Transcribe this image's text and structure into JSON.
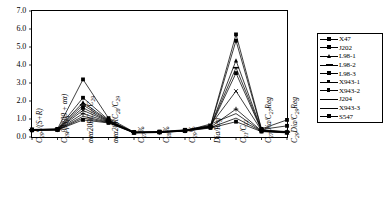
{
  "chart_data": {
    "type": "line",
    "title": "",
    "xlabel": "",
    "ylabel": "",
    "ylim": [
      0.0,
      7.0
    ],
    "ytick_labels": [
      "0.0",
      "1.0",
      "2.0",
      "3.0",
      "4.0",
      "5.0",
      "6.0",
      "7.0"
    ],
    "ytick_values": [
      0.0,
      1.0,
      2.0,
      3.0,
      4.0,
      5.0,
      6.0,
      7.0
    ],
    "grid": false,
    "legend_position": "right",
    "categories": [
      "C29S/(S+R)",
      "C29BB/(BB+aa)",
      "aaa20RC27/C29",
      "aaa20RC28/C29",
      "C27%",
      "C28%",
      "C29%",
      "Dia/Reg",
      "C21/C22",
      "C27Dia/C27Reg",
      "C29Dia/C29Reg"
    ],
    "categories_display": [
      {
        "parts": [
          {
            "t": "C",
            "i": true
          },
          {
            "t": "29",
            "sub": true
          },
          {
            "t": "S/(S+R)",
            "i": true
          }
        ]
      },
      {
        "parts": [
          {
            "t": "C",
            "i": true
          },
          {
            "t": "29",
            "sub": true
          },
          {
            "t": "ββ/(ββ + αα)",
            "i": true
          }
        ]
      },
      {
        "parts": [
          {
            "t": "ααα20RC",
            "i": true
          },
          {
            "t": "27",
            "sub": true
          },
          {
            "t": "/C",
            "i": true
          },
          {
            "t": "29",
            "sub": true
          }
        ]
      },
      {
        "parts": [
          {
            "t": "ααα20RC",
            "i": true
          },
          {
            "t": "28",
            "sub": true
          },
          {
            "t": "/C",
            "i": true
          },
          {
            "t": "29",
            "sub": true
          }
        ]
      },
      {
        "parts": [
          {
            "t": "C",
            "i": true
          },
          {
            "t": "27",
            "sub": true
          },
          {
            "t": "%",
            "i": true
          }
        ]
      },
      {
        "parts": [
          {
            "t": "C",
            "i": true
          },
          {
            "t": "28",
            "sub": true
          },
          {
            "t": "%",
            "i": true
          }
        ]
      },
      {
        "parts": [
          {
            "t": "C",
            "i": true
          },
          {
            "t": "29",
            "sub": true
          },
          {
            "t": "%",
            "i": true
          }
        ]
      },
      {
        "parts": [
          {
            "t": "Dia/Reg",
            "i": true
          }
        ]
      },
      {
        "parts": [
          {
            "t": "C",
            "i": true
          },
          {
            "t": "21",
            "sub": true
          },
          {
            "t": "/C",
            "i": true
          },
          {
            "t": "22",
            "sub": true
          }
        ]
      },
      {
        "parts": [
          {
            "t": "C",
            "i": true
          },
          {
            "t": "27",
            "sub": true
          },
          {
            "t": "Dia/C",
            "i": true
          },
          {
            "t": "27",
            "sub": true
          },
          {
            "t": "Reg",
            "i": true
          }
        ]
      },
      {
        "parts": [
          {
            "t": "C",
            "i": true
          },
          {
            "t": "29",
            "sub": true
          },
          {
            "t": "Dia/C",
            "i": true
          },
          {
            "t": "29",
            "sub": true
          },
          {
            "t": "Reg",
            "i": true
          }
        ]
      }
    ],
    "series": [
      {
        "name": "X47",
        "marker": "square",
        "values": [
          0.42,
          0.45,
          3.2,
          1.05,
          0.28,
          0.3,
          0.4,
          0.62,
          5.7,
          0.45,
          0.95
        ]
      },
      {
        "name": "J202",
        "marker": "square-filled",
        "values": [
          0.4,
          0.44,
          2.18,
          0.95,
          0.26,
          0.29,
          0.38,
          0.6,
          5.35,
          0.42,
          0.62
        ]
      },
      {
        "name": "L98-1",
        "marker": "triangle",
        "values": [
          0.41,
          0.43,
          1.92,
          0.92,
          0.27,
          0.28,
          0.37,
          0.58,
          4.25,
          0.4,
          0.3
        ]
      },
      {
        "name": "L98-2",
        "marker": "dash",
        "values": [
          0.4,
          0.42,
          1.78,
          0.9,
          0.26,
          0.28,
          0.36,
          0.57,
          3.85,
          0.38,
          0.28
        ]
      },
      {
        "name": "L98-3",
        "marker": "square-filled",
        "values": [
          0.39,
          0.42,
          1.62,
          0.88,
          0.25,
          0.27,
          0.36,
          0.56,
          3.55,
          0.37,
          0.27
        ]
      },
      {
        "name": "X943-1",
        "marker": "cross",
        "values": [
          0.4,
          0.41,
          1.48,
          0.86,
          0.25,
          0.27,
          0.35,
          0.66,
          2.55,
          0.36,
          0.26
        ]
      },
      {
        "name": "X943-2",
        "marker": "plus",
        "values": [
          0.38,
          0.4,
          1.3,
          0.84,
          0.24,
          0.26,
          0.34,
          0.55,
          1.55,
          0.34,
          0.25
        ]
      },
      {
        "name": "J204",
        "marker": "none",
        "values": [
          0.38,
          0.4,
          1.15,
          0.82,
          0.24,
          0.26,
          0.34,
          0.72,
          1.3,
          0.33,
          0.24
        ]
      },
      {
        "name": "X943-3",
        "marker": "none",
        "values": [
          0.37,
          0.39,
          1.05,
          0.8,
          0.23,
          0.25,
          0.33,
          0.52,
          1.05,
          0.32,
          0.24
        ]
      },
      {
        "name": "S547",
        "marker": "square-filled",
        "values": [
          0.37,
          0.39,
          0.95,
          0.78,
          0.23,
          0.25,
          0.33,
          0.5,
          0.85,
          0.3,
          0.23
        ]
      }
    ]
  },
  "legend": {
    "entries": [
      "X47",
      "J202",
      "L98-1",
      "L98-2",
      "L98-3",
      "X943-1",
      "X943-2",
      "J204",
      "X943-3",
      "S547"
    ]
  },
  "colors": {
    "line": "#000000",
    "axis": "#000000",
    "background": "#ffffff"
  }
}
